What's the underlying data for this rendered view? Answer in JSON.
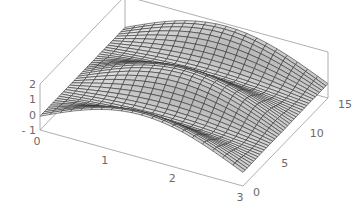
{
  "chart_data": {
    "type": "surface3d",
    "title": "",
    "xlabel": "",
    "ylabel": "",
    "zlabel": "",
    "x_range": [
      0,
      3
    ],
    "y_range": [
      0,
      15
    ],
    "z_range": [
      -1,
      2
    ],
    "x_ticks": [
      "0",
      "1",
      "2",
      "3"
    ],
    "y_ticks": [
      "0",
      "5",
      "10",
      "15"
    ],
    "z_ticks": [
      "-1",
      "0",
      "1",
      "2"
    ],
    "mesh": {
      "nx": 20,
      "ny": 40
    },
    "function_hint": "z ≈ sin(x)·(1 + 0.6·cos(2π·y/7.5)) style wavy ridges, peak ~2 near x≈1.6",
    "surface_color": "#c8c8c8",
    "mesh_color": "#303030",
    "box_color": "#9a9a9a",
    "grid": false,
    "legend": null
  }
}
